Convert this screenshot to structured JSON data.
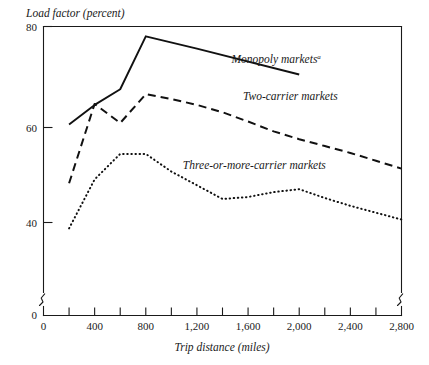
{
  "chart_data": {
    "type": "line",
    "title": "",
    "xlabel": "Trip distance (miles)",
    "ylabel": "Load factor (percent)",
    "xlim": [
      0,
      2800
    ],
    "ylim": [
      0,
      80
    ],
    "y_axis_break": true,
    "y_break_between": [
      0,
      38
    ],
    "x_axis_break_right": true,
    "grid": false,
    "legend_position": "inline-annotation",
    "xticks_major": [
      0,
      400,
      800,
      1200,
      1600,
      2000,
      2400,
      2800
    ],
    "xticks_major_labels": [
      "0",
      "400",
      "800",
      "1,200",
      "1,600",
      "2,000",
      "2,400",
      "2,800"
    ],
    "xticks_minor": [
      200,
      600,
      1000,
      1400,
      1800,
      2200,
      2600
    ],
    "yticks": [
      0,
      40,
      60,
      80
    ],
    "ytick_labels": [
      "0",
      "40",
      "60",
      "80"
    ],
    "series": [
      {
        "name": "Monopoly markets",
        "style": "solid",
        "footnote_marker": "a",
        "label_x": 1470,
        "label_y": 72.6,
        "x": [
          200,
          400,
          600,
          800,
          1200,
          2000
        ],
        "values": [
          60.0,
          64.0,
          67.2,
          78.0,
          75.5,
          70.2
        ]
      },
      {
        "name": "Two-carrier markets",
        "style": "dashed",
        "footnote_marker": "",
        "label_x": 1560,
        "label_y": 65.0,
        "x": [
          200,
          400,
          600,
          800,
          1000,
          1200,
          1400,
          1600,
          1800,
          2000,
          2200,
          2400,
          2600,
          2800
        ],
        "values": [
          48.0,
          64.2,
          60.3,
          66.2,
          65.2,
          64.0,
          62.5,
          60.6,
          58.6,
          57.0,
          55.6,
          54.2,
          52.6,
          51.0
        ]
      },
      {
        "name": "Three-or-more-carrier markets",
        "style": "dotted",
        "footnote_marker": "",
        "label_x": 1090,
        "label_y": 51.0,
        "x": [
          200,
          400,
          600,
          800,
          1000,
          1200,
          1400,
          1600,
          1800,
          2000,
          2200,
          2400,
          2600,
          2800
        ],
        "values": [
          38.8,
          48.8,
          54.0,
          54.0,
          50.4,
          47.6,
          44.8,
          45.2,
          46.2,
          46.8,
          45.0,
          43.4,
          42.0,
          40.6
        ]
      }
    ]
  },
  "labels": {
    "y_axis_title": "Load factor (percent)",
    "x_axis_title": "Trip distance (miles)",
    "series_monopoly": "Monopoly markets",
    "series_monopoly_mark": "a",
    "series_two_carrier": "Two-carrier markets",
    "series_three_carrier": "Three-or-more-carrier markets",
    "ytick_80": "80",
    "ytick_60": "60",
    "ytick_40": "40",
    "ytick_0": "0",
    "xtick_0": "0",
    "xtick_400": "400",
    "xtick_800": "800",
    "xtick_1200": "1,200",
    "xtick_1600": "1,600",
    "xtick_2000": "2,000",
    "xtick_2400": "2,400",
    "xtick_2800": "2,800"
  },
  "colors": {
    "ink": "#111111",
    "background": "#ffffff"
  }
}
